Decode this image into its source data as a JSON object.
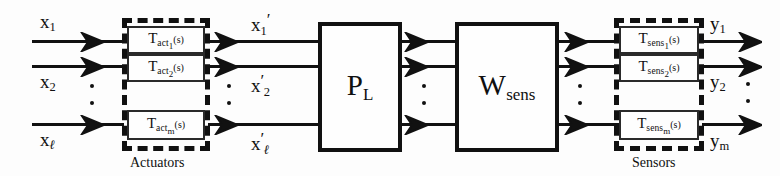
{
  "diagram": {
    "background_color": "#fdfdfd",
    "line_color": "#111111",
    "inputs": [
      {
        "name": "x1",
        "base": "x",
        "sub": "1"
      },
      {
        "name": "x2",
        "base": "x",
        "sub": "2"
      },
      {
        "name": "xl",
        "base": "x",
        "sub": "ℓ"
      }
    ],
    "intermediates": [
      {
        "name": "x1-prime",
        "base": "x",
        "sub": "1",
        "prime": "′",
        "prime_position": "after-sub"
      },
      {
        "name": "x2-prime",
        "base": "x",
        "sub": "2",
        "prime": "′",
        "prime_position": "before-sub"
      },
      {
        "name": "xl-prime",
        "base": "x",
        "sub": "ℓ",
        "prime": "′",
        "prime_position": "before-sub"
      }
    ],
    "outputs": [
      {
        "name": "y1",
        "base": "y",
        "sub": "1"
      },
      {
        "name": "y2",
        "base": "y",
        "sub": "2"
      },
      {
        "name": "ym",
        "base": "y",
        "sub": "m"
      }
    ],
    "actuator_group": {
      "caption": "Actuators",
      "blocks": [
        {
          "name": "T-act-1",
          "symbol": "T",
          "sub": "act",
          "index": "1",
          "arg": "(s)"
        },
        {
          "name": "T-act-2",
          "symbol": "T",
          "sub": "act",
          "index": "2",
          "arg": "(s)"
        },
        {
          "name": "T-act-m",
          "symbol": "T",
          "sub": "act",
          "index": "m",
          "arg": "(s)"
        }
      ]
    },
    "sensor_group": {
      "caption": "Sensors",
      "blocks": [
        {
          "name": "T-sens-1",
          "symbol": "T",
          "sub": "sens",
          "index": "1",
          "arg": "(s)"
        },
        {
          "name": "T-sens-2",
          "symbol": "T",
          "sub": "sens",
          "index": "2",
          "arg": "(s)"
        },
        {
          "name": "T-sens-m",
          "symbol": "T",
          "sub": "sens",
          "index": "m",
          "arg": "(s)"
        }
      ]
    },
    "plant_block": {
      "name": "P-L",
      "symbol": "P",
      "sub": "L"
    },
    "weight_block": {
      "name": "W-sens",
      "symbol": "W",
      "sub": "sens"
    }
  }
}
